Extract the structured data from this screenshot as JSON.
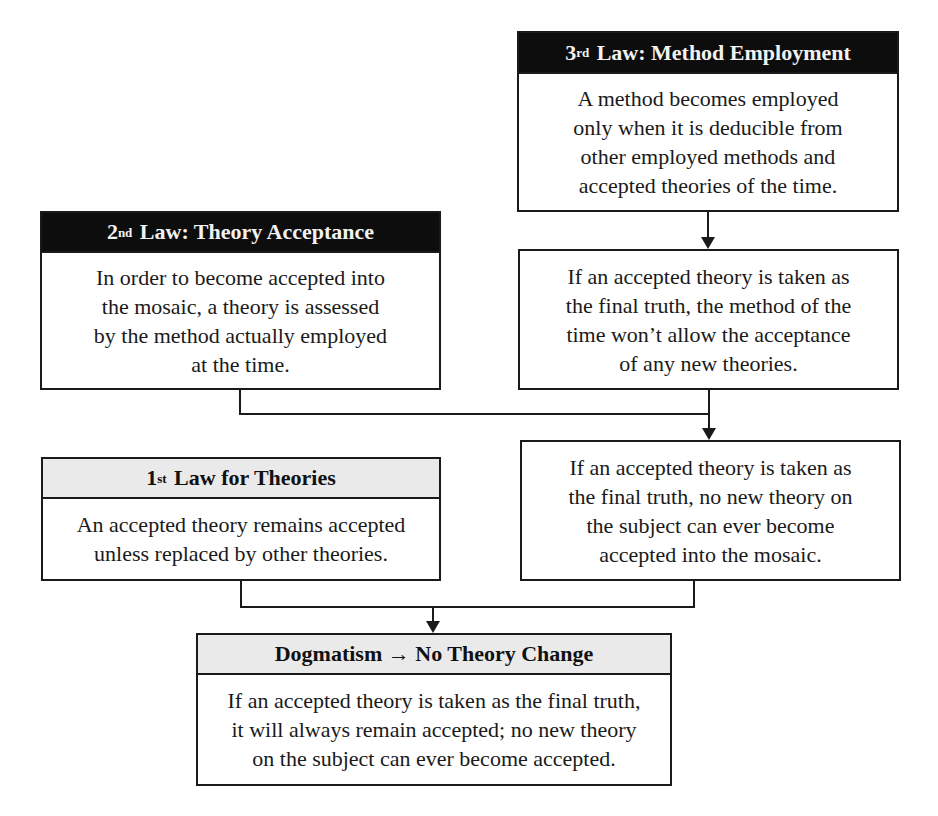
{
  "diagram": {
    "type": "flowchart",
    "nodes": [
      {
        "id": "third_law",
        "title_ordinal": "3",
        "title_suffix": "rd",
        "title_rest": " Law: Method Employment",
        "body_lines": [
          "A method becomes employed",
          "only when it is deducible from",
          "other employed methods and",
          "accepted theories of the time."
        ]
      },
      {
        "id": "second_law",
        "title_ordinal": "2",
        "title_suffix": "nd",
        "title_rest": " Law: Theory Acceptance",
        "body_lines": [
          "In order to become accepted into",
          "the mosaic, a theory is assessed",
          "by the method actually employed",
          "at the time."
        ]
      },
      {
        "id": "method_consequence",
        "body_lines": [
          "If an accepted theory is taken as",
          "the final truth, the method of the",
          "time won’t allow the acceptance",
          "of any new theories."
        ]
      },
      {
        "id": "no_new_theory",
        "body_lines": [
          "If an accepted theory is taken as",
          "the final truth, no new theory on",
          "the subject can ever become",
          "accepted into the mosaic."
        ]
      },
      {
        "id": "first_law",
        "title_ordinal": "1",
        "title_suffix": "st",
        "title_rest": " Law for Theories",
        "body_lines": [
          "An accepted theory remains accepted",
          "unless replaced by other theories."
        ]
      },
      {
        "id": "dogmatism",
        "title": "Dogmatism → No Theory Change",
        "body_lines": [
          "If an accepted theory is taken as the final truth,",
          "it will always remain accepted; no new theory",
          "on the subject can ever become accepted."
        ]
      }
    ],
    "edges": [
      {
        "from": "third_law",
        "to": "method_consequence"
      },
      {
        "from": "second_law",
        "to": "no_new_theory"
      },
      {
        "from": "method_consequence",
        "to": "no_new_theory"
      },
      {
        "from": "first_law",
        "to": "dogmatism"
      },
      {
        "from": "no_new_theory",
        "to": "dogmatism"
      }
    ],
    "colors": {
      "dark_header_bg": "#0d0d0d",
      "dark_header_text": "#f2f2f2",
      "light_header_bg": "#eaeaea",
      "stroke": "#1a1a1a"
    }
  }
}
